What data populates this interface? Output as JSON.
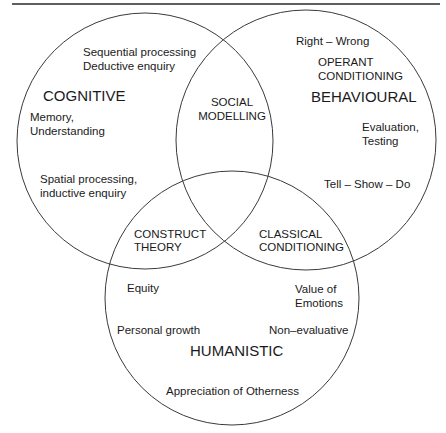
{
  "diagram": {
    "type": "venn",
    "stroke_color": "#3a3a3a",
    "text_color": "#1a1a1a",
    "top_rule": {
      "x1": 12,
      "x2": 440,
      "y": 4
    },
    "circles": [
      {
        "id": "cognitive",
        "cx": 145,
        "cy": 141,
        "r": 128
      },
      {
        "id": "behavioural",
        "cx": 306,
        "cy": 140,
        "r": 130
      },
      {
        "id": "humanistic",
        "cx": 232,
        "cy": 298,
        "r": 127
      }
    ]
  },
  "cognitive": {
    "title": "COGNITIVE",
    "items": {
      "sequential": "Sequential processing",
      "deductive": "Deductive enquiry",
      "memory": "Memory,",
      "understanding": "Understanding",
      "spatial": "Spatial processing,",
      "inductive": "inductive enquiry"
    }
  },
  "behavioural": {
    "title": "BEHAVIOURAL",
    "items": {
      "right_wrong": "Right – Wrong",
      "operant_1": "OPERANT",
      "operant_2": "CONDITIONING",
      "evaluation": "Evaluation,",
      "testing": "Testing",
      "tell_show_do": "Tell – Show – Do"
    }
  },
  "humanistic": {
    "title": "HUMANISTIC",
    "items": {
      "equity": "Equity",
      "value_of": "Value of",
      "emotions": "Emotions",
      "personal_growth": "Personal growth",
      "non_evaluative": "Non–evaluative",
      "otherness": "Appreciation of Otherness"
    }
  },
  "overlaps": {
    "social_modelling": {
      "line1": "SOCIAL",
      "line2": "MODELLING"
    },
    "construct_theory": {
      "line1": "CONSTRUCT",
      "line2": "THEORY"
    },
    "classical_conditioning": {
      "line1": "CLASSICAL",
      "line2": "CONDITIONING"
    }
  }
}
